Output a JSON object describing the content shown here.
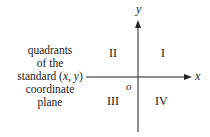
{
  "caption": {
    "line1": "quadrants",
    "line2": "of the",
    "line3": "standard (x, y)",
    "line4": "coordinate",
    "line5": "plane"
  },
  "axes": {
    "x_label": "x",
    "y_label": "y",
    "origin_label": "o"
  },
  "quadrants": {
    "q1": "I",
    "q2": "II",
    "q3": "III",
    "q4": "IV"
  }
}
